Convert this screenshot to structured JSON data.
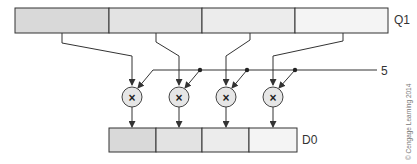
{
  "diagram": {
    "source_register": {
      "label": "Q1",
      "lanes": 4,
      "lane_fills": [
        "#d9d9d9",
        "#e3e3e3",
        "#ececec",
        "#f4f4f4"
      ]
    },
    "scalar": {
      "label": "5"
    },
    "operations": [
      {
        "symbol": "×"
      },
      {
        "symbol": "×"
      },
      {
        "symbol": "×"
      },
      {
        "symbol": "×"
      }
    ],
    "dest_register": {
      "label": "D0",
      "lanes": 4,
      "lane_fills": [
        "#d9d9d9",
        "#e3e3e3",
        "#ececec",
        "#f4f4f4"
      ]
    },
    "copyright": "© Cengage Learning 2014",
    "colors": {
      "stroke": "#333333",
      "multiplier_fill": "#e6e6e6"
    }
  }
}
